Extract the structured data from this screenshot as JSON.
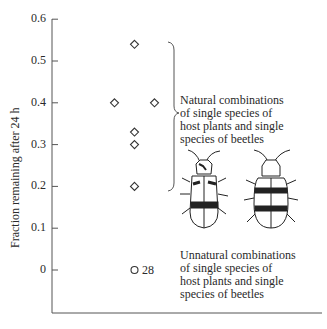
{
  "chart_data": {
    "type": "scatter",
    "title": "",
    "xlabel": "",
    "ylabel": "Fraction remaining after 24 h",
    "ylim": [
      -0.08,
      0.6
    ],
    "yticks": [
      0,
      0.1,
      0.2,
      0.3,
      0.4,
      0.5,
      0.6
    ],
    "ytick_labels": [
      "0",
      "0.1",
      "0.2",
      "0.3",
      "0.4",
      "0.5",
      "0.6"
    ],
    "grid": false,
    "series": [
      {
        "name": "Natural combinations of single species of host plants and single species of beetles",
        "marker": "diamond",
        "points": [
          {
            "x": 0,
            "y": 0.54
          },
          {
            "x": -1,
            "y": 0.4
          },
          {
            "x": 1,
            "y": 0.4
          },
          {
            "x": 0,
            "y": 0.33
          },
          {
            "x": 0,
            "y": 0.3
          },
          {
            "x": 0,
            "y": 0.2
          }
        ]
      },
      {
        "name": "Unnatural combinations of single species of host plants and single species of beetles",
        "marker": "circle",
        "points": [
          {
            "x": 0,
            "y": 0,
            "count": 28
          }
        ]
      }
    ],
    "annotations": [
      "Natural combinations of single species of host plants and single species of beetles",
      "Unnatural combinations of single species of host plants and single species of beetles",
      "28"
    ]
  },
  "labels": {
    "ylabel": "Fraction remaining after 24 h",
    "ticks": [
      "0.6",
      "0.5",
      "0.4",
      "0.3",
      "0.2",
      "0.1",
      "0"
    ],
    "natural_lines": [
      "Natural combinations",
      "of single species of",
      "host plants and single",
      "species of beetles"
    ],
    "unnatural_lines": [
      "Unnatural combinations",
      "of single species of",
      "host plants and single",
      "species of beetles"
    ],
    "count_label": "28"
  },
  "illustrations": [
    "beetle-illustration-left",
    "beetle-illustration-right"
  ]
}
